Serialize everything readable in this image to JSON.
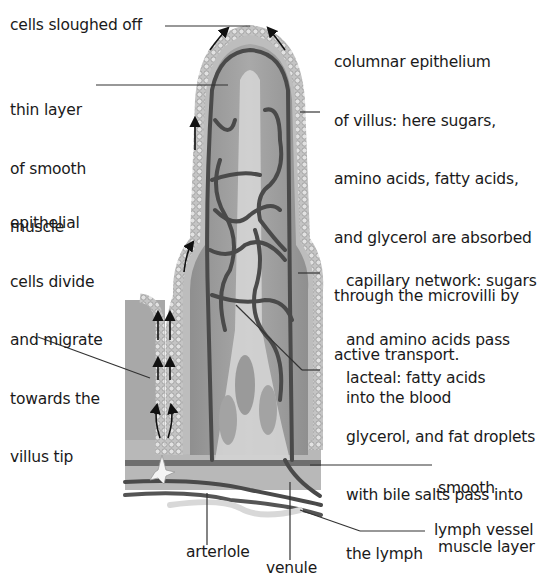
{
  "diagram": {
    "labels": {
      "cells_sloughed_off": "cells sloughed off",
      "thin_layer": [
        "thin layer",
        "of smooth",
        "muscle"
      ],
      "epithelial_cells": [
        "epithelial",
        "cells divide",
        "and migrate",
        "towards the",
        "villus tip"
      ],
      "columnar_epithelium": [
        "columnar epithelium",
        "of villus: here sugars,",
        "amino acids, fatty acids,",
        "and glycerol are absorbed",
        "through the microvilli by",
        "active transport."
      ],
      "capillary_network": [
        "capillary network: sugars",
        "and amino acids pass",
        "into the blood"
      ],
      "lacteal": [
        "lacteal: fatty acids",
        "glycerol, and fat droplets",
        "with bile salts pass into",
        "the lymph"
      ],
      "smooth_muscle_layer": [
        "smooth",
        "muscle layer"
      ],
      "lymph_vessel": "lymph vessel",
      "arteriole": "arterlole",
      "venule": "venule"
    },
    "colors": {
      "epithelium": "#bdbdbd",
      "cell_outline": "#8a8a8a",
      "villus_core": "#9c9c9c",
      "lacteal": "#d6d6d6",
      "vessel": "#4a4a4a",
      "muscle_band": "#6e6e6e",
      "tissue_base": "#b3b3b3",
      "leader_line": "#333333"
    }
  }
}
